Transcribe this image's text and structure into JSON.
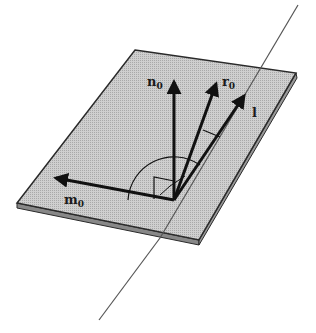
{
  "figure": {
    "labels": {
      "n": {
        "base": "n",
        "sub": "0"
      },
      "r": {
        "base": "r",
        "sub": "0"
      },
      "l": {
        "base": "l"
      },
      "m": {
        "base": "m",
        "sub": "0"
      }
    }
  },
  "colors": {
    "plate_fill": "#c4c4c4",
    "plate_edge": "#2a2a2a",
    "ink": "#111111",
    "line": "#555555"
  }
}
